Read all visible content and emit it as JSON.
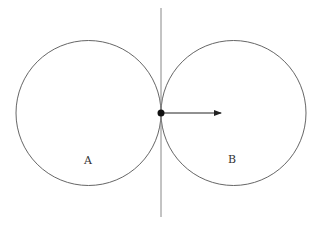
{
  "diagram": {
    "labels": {
      "a": "A",
      "b": "B"
    },
    "colors": {
      "stroke": "#555555",
      "line": "#888888",
      "dot": "#111111"
    },
    "circle_a": {
      "cx": 88.5,
      "cy": 113,
      "r": 72.5
    },
    "circle_b": {
      "cx": 233.5,
      "cy": 113,
      "r": 72.5
    },
    "vertical_line": {
      "x": 161,
      "y1": 8,
      "y2": 217
    },
    "contact_point": {
      "x": 161,
      "y": 113,
      "r": 3.5
    },
    "arrow": {
      "x1": 161,
      "y1": 113,
      "x2": 222,
      "y2": 113,
      "direction": "right"
    }
  }
}
